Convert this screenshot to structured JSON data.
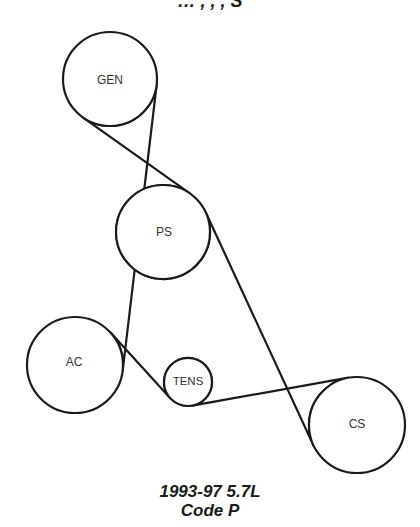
{
  "header": {
    "title_partial": "… , , , S"
  },
  "diagram": {
    "type": "serpentine-belt-routing",
    "pulleys": [
      {
        "id": "gen",
        "label": "GEN"
      },
      {
        "id": "ps",
        "label": "PS"
      },
      {
        "id": "ac",
        "label": "AC"
      },
      {
        "id": "tens",
        "label": "TENS"
      },
      {
        "id": "cs",
        "label": "CS"
      }
    ],
    "belt_route": [
      "GEN",
      "AC",
      "TENS",
      "CS",
      "PS",
      "GEN"
    ]
  },
  "caption": {
    "line1": "1993-97 5.7L",
    "line2": "Code P"
  }
}
